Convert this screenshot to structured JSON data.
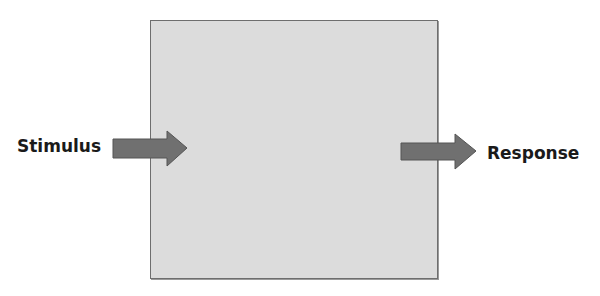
{
  "diagram": {
    "box": {
      "label": "",
      "fill": "#dcdcdc",
      "stroke": "#6e6e6e"
    },
    "input": {
      "label": "Stimulus",
      "arrow_color": "#707070"
    },
    "output": {
      "label": "Response",
      "arrow_color": "#707070"
    }
  }
}
